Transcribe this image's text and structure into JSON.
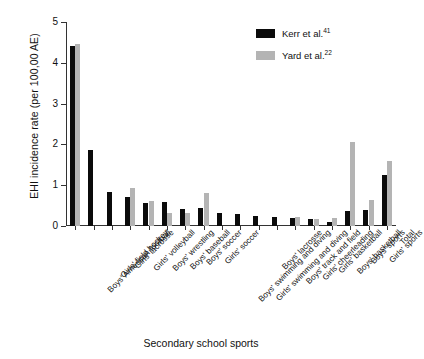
{
  "chart_data": {
    "type": "bar",
    "title": "",
    "xlabel": "Secondary school sports",
    "ylabel": "EHI incidence rate (per 100,00 AE)",
    "ylim": [
      0,
      5
    ],
    "yticks": [
      0,
      1,
      2,
      3,
      4,
      5
    ],
    "grid": false,
    "legend_position": "top-right",
    "categories": [
      "Boys' American football",
      "Girls' field hockey",
      "Girls' lacrosse",
      "Girls' volleyball",
      "Boys' wrestling",
      "Boys' baseball",
      "Boys' soccer",
      "Girls' soccer",
      "Boys' swimming and diving",
      "Girls' swimming and diving",
      "Boys' lacrosse",
      "Boys' track and field",
      "Girls' cheerleading",
      "Girls' basketball",
      "Boys' basketball",
      "Boys' sports",
      "Girls' sports",
      "Total"
    ],
    "series": [
      {
        "name": "Kerr et al.",
        "reference": "41",
        "color": "#0b0b0b",
        "values": [
          4.42,
          1.87,
          0.83,
          0.71,
          0.56,
          0.6,
          0.41,
          0.45,
          0.33,
          0.29,
          0.25,
          0.22,
          0.2,
          0.17,
          0.1,
          0.38,
          0.4,
          1.25
        ]
      },
      {
        "name": "Yard et al.",
        "reference": "22",
        "color": "#b4b4b4",
        "values": [
          4.45,
          null,
          null,
          0.93,
          0.61,
          0.33,
          0.33,
          0.8,
          null,
          null,
          null,
          null,
          0.22,
          0.16,
          0.2,
          2.05,
          0.63,
          1.6
        ]
      }
    ]
  },
  "legend": {
    "entries": [
      {
        "label": "Kerr et al.",
        "superscript": "41",
        "color": "#0b0b0b"
      },
      {
        "label": "Yard et al.",
        "superscript": "22",
        "color": "#b4b4b4"
      }
    ]
  },
  "axes": {
    "y_title": "EHI incidence rate (per 100,00 AE)",
    "x_title": "Secondary school sports",
    "y_tick_labels": [
      "0",
      "1",
      "2",
      "3",
      "4",
      "5"
    ]
  }
}
